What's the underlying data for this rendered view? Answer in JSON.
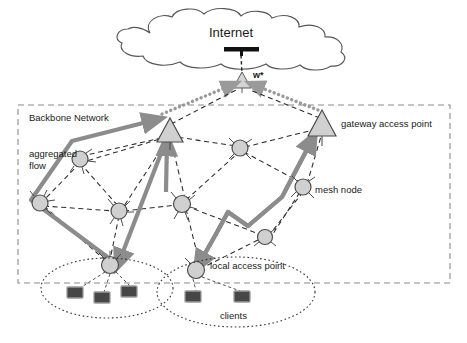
{
  "diagram": {
    "title_node": "Internet",
    "gateway_marker_label": "w*",
    "region_label": "Backbone Network",
    "labels": {
      "aggregated_flow_line1": "aggregated",
      "aggregated_flow_line2": "flow",
      "gateway_access_point": "gateway access point",
      "mesh_node": "mesh node",
      "local_access_point": "local access point",
      "clients": "clients"
    },
    "colors": {
      "node_fill": "#d0d0d0",
      "node_stroke": "#4d4d4d",
      "flow_arrow": "#8c8c8c",
      "dashed_link": "#2b2b2b",
      "client_fill": "#474747",
      "client_stroke": "#9a9a9a",
      "cloud_stroke": "#555555",
      "text": "#1a1a1a"
    },
    "nodes": {
      "mesh_nodes": [
        {
          "id": "m1",
          "x": 80,
          "y": 159
        },
        {
          "id": "m2",
          "x": 40,
          "y": 203
        },
        {
          "id": "m3",
          "x": 119,
          "y": 211
        },
        {
          "id": "m4",
          "x": 182,
          "y": 204
        },
        {
          "id": "m5",
          "x": 240,
          "y": 148
        },
        {
          "id": "m6",
          "x": 303,
          "y": 187
        },
        {
          "id": "m7",
          "x": 265,
          "y": 237
        },
        {
          "id": "m8",
          "x": 110,
          "y": 265
        },
        {
          "id": "m9",
          "x": 196,
          "y": 270
        }
      ],
      "gateways": [
        {
          "id": "g1",
          "x": 170,
          "y": 130
        },
        {
          "id": "g2",
          "x": 322,
          "y": 124
        }
      ],
      "core_gateway": {
        "id": "w",
        "x": 243,
        "y": 80
      },
      "clients": [
        {
          "x": 74,
          "y": 292
        },
        {
          "x": 101,
          "y": 297
        },
        {
          "x": 128,
          "y": 291
        },
        {
          "x": 192,
          "y": 296
        },
        {
          "x": 241,
          "y": 296
        }
      ]
    }
  }
}
